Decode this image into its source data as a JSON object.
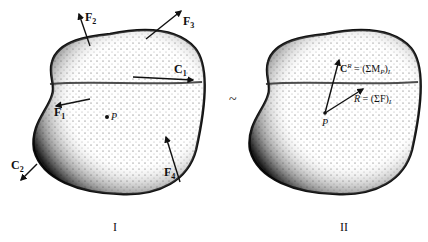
{
  "figure": {
    "equivalence_symbol": "~",
    "panel_I": {
      "caption": "I",
      "point_label": "P",
      "force_labels": {
        "F1": {
          "base": "F",
          "sub": "1"
        },
        "F2": {
          "base": "F",
          "sub": "2"
        },
        "F3": {
          "base": "F",
          "sub": "3"
        },
        "F4": {
          "base": "F",
          "sub": "4"
        }
      },
      "couple_labels": {
        "C1": {
          "base": "C",
          "sub": "1"
        },
        "C2": {
          "base": "C",
          "sub": "2"
        }
      }
    },
    "panel_II": {
      "caption": "II",
      "point_label": "P",
      "couple_resultant": {
        "base": "C",
        "sup": "R",
        "eq": " = (ΣM",
        "sub1": "P",
        "close": ")",
        "sub2": "I"
      },
      "force_resultant": {
        "base": "R",
        "eq": " = (ΣF)",
        "sub": "I"
      }
    }
  }
}
